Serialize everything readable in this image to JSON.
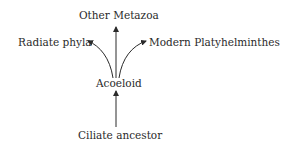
{
  "diagram": {
    "type": "phylogenetic-tree",
    "nodes": {
      "top": "Other Metazoa",
      "left": "Radiate phyla",
      "right": "Modern Platyhelminthes",
      "middle": "Acoeloid",
      "bottom": "Ciliate ancestor"
    },
    "edges": [
      {
        "from": "Ciliate ancestor",
        "to": "Acoeloid"
      },
      {
        "from": "Acoeloid",
        "to": "Other Metazoa"
      },
      {
        "from": "Acoeloid",
        "to": "Radiate phyla"
      },
      {
        "from": "Acoeloid",
        "to": "Modern Platyhelminthes"
      }
    ],
    "colors": {
      "ink": "#2a2a2a",
      "background": "#ffffff"
    }
  }
}
